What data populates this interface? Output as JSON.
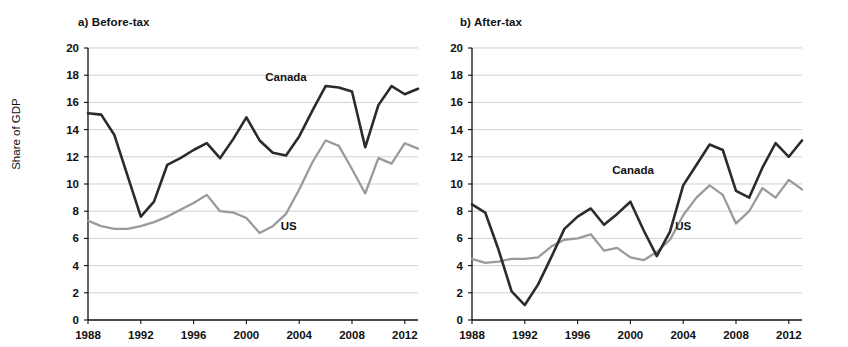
{
  "figure": {
    "ylabel": "Share of GDP",
    "canada_label": "Canada",
    "us_label": "US",
    "canada_color": "#2b2b2b",
    "us_color": "#9a9a9a",
    "gridline_color": "#b9bcc4",
    "axis_color": "#111111"
  },
  "chart_data": [
    {
      "type": "line",
      "title": "a) Before-tax",
      "xlabel": "",
      "ylabel": "Share of GDP",
      "ylim": [
        0,
        20
      ],
      "xlim": [
        1988,
        2013
      ],
      "ytick_labels": [
        "0",
        "2",
        "4",
        "6",
        "8",
        "10",
        "12",
        "14",
        "16",
        "18",
        "20"
      ],
      "yticks": [
        0,
        2,
        4,
        6,
        8,
        10,
        12,
        14,
        16,
        18,
        20
      ],
      "xtick_labels": [
        "1988",
        "1992",
        "1996",
        "2000",
        "2004",
        "2008",
        "2012"
      ],
      "xticks": [
        1988,
        1992,
        1996,
        2000,
        2004,
        2008,
        2012
      ],
      "grid": true,
      "legend": "inline-annotations",
      "x": [
        1988,
        1989,
        1990,
        1991,
        1992,
        1993,
        1994,
        1995,
        1996,
        1997,
        1998,
        1999,
        2000,
        2001,
        2002,
        2003,
        2004,
        2005,
        2006,
        2007,
        2008,
        2009,
        2010,
        2011,
        2012,
        2013
      ],
      "series": [
        {
          "name": "Canada",
          "color": "#2b2b2b",
          "values": [
            15.2,
            15.1,
            13.6,
            10.6,
            7.6,
            8.7,
            11.4,
            11.9,
            12.5,
            13.0,
            11.9,
            13.3,
            14.9,
            13.2,
            12.3,
            12.1,
            13.5,
            15.4,
            17.2,
            17.1,
            16.8,
            12.7,
            15.8,
            17.2,
            16.6,
            17.0
          ],
          "label_x": 2003.0,
          "label_y": 17.6
        },
        {
          "name": "US",
          "color": "#9a9a9a",
          "values": [
            7.3,
            6.9,
            6.7,
            6.7,
            6.9,
            7.2,
            7.6,
            8.1,
            8.6,
            9.2,
            8.0,
            7.9,
            7.5,
            6.4,
            6.9,
            7.8,
            9.6,
            11.6,
            13.2,
            12.8,
            11.1,
            9.3,
            11.9,
            11.5,
            13.0,
            12.6
          ],
          "label_x": 2003.2,
          "label_y": 6.6
        }
      ]
    },
    {
      "type": "line",
      "title": "b) After-tax",
      "xlabel": "",
      "ylabel": "Share of GDP",
      "ylim": [
        0,
        20
      ],
      "xlim": [
        1988,
        2013
      ],
      "ytick_labels": [
        "0",
        "2",
        "4",
        "6",
        "8",
        "10",
        "12",
        "14",
        "16",
        "18",
        "20"
      ],
      "yticks": [
        0,
        2,
        4,
        6,
        8,
        10,
        12,
        14,
        16,
        18,
        20
      ],
      "xtick_labels": [
        "1988",
        "1992",
        "1996",
        "2000",
        "2004",
        "2008",
        "2012"
      ],
      "xticks": [
        1988,
        1992,
        1996,
        2000,
        2004,
        2008,
        2012
      ],
      "grid": true,
      "legend": "inline-annotations",
      "x": [
        1988,
        1989,
        1990,
        1991,
        1992,
        1993,
        1994,
        1995,
        1996,
        1997,
        1998,
        1999,
        2000,
        2001,
        2002,
        2003,
        2004,
        2005,
        2006,
        2007,
        2008,
        2009,
        2010,
        2011,
        2012,
        2013
      ],
      "series": [
        {
          "name": "Canada",
          "color": "#2b2b2b",
          "values": [
            8.5,
            7.9,
            5.2,
            2.1,
            1.1,
            2.6,
            4.6,
            6.7,
            7.6,
            8.2,
            7.0,
            7.8,
            8.7,
            6.6,
            4.7,
            6.5,
            9.9,
            11.4,
            12.9,
            12.5,
            9.5,
            9.0,
            11.2,
            13.0,
            12.0,
            13.2
          ],
          "label_x": 2000.2,
          "label_y": 10.7
        },
        {
          "name": "US",
          "color": "#9a9a9a",
          "values": [
            4.5,
            4.2,
            4.3,
            4.5,
            4.5,
            4.6,
            5.4,
            5.9,
            6.0,
            6.3,
            5.1,
            5.3,
            4.6,
            4.4,
            5.0,
            5.9,
            7.7,
            9.0,
            9.9,
            9.2,
            7.1,
            8.0,
            9.7,
            9.0,
            10.3,
            9.6
          ],
          "label_x": 2004.0,
          "label_y": 6.6
        }
      ]
    }
  ]
}
